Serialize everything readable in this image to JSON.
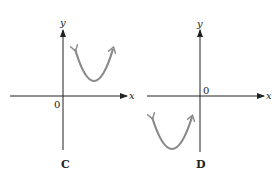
{
  "panels": [
    {
      "caption": "C",
      "x_axis_label": "x",
      "y_axis_label": "y",
      "origin_label": "0",
      "description": "Upward-opening parabola with vertex in quadrant I (above x-axis, right of y-axis)"
    },
    {
      "caption": "D",
      "x_axis_label": "x",
      "y_axis_label": "y",
      "origin_label": "0",
      "description": "Upward-opening parabola with vertex in quadrant III (below x-axis, left of y-axis)"
    }
  ],
  "colors": {
    "axis": "#222222",
    "curve": "#8a8a8a"
  }
}
